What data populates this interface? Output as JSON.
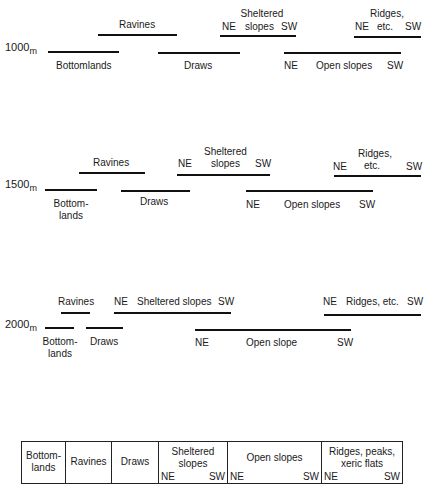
{
  "diagram": {
    "type": "topographic-position-diagram",
    "elevations": [
      {
        "value": "1000",
        "unit": "m",
        "positions": [
          {
            "name": "Bottomlands",
            "x1": 48,
            "x2": 119,
            "y": 52,
            "label_pos": "below"
          },
          {
            "name": "Ravines",
            "x1": 98,
            "x2": 177,
            "y": 35,
            "label_pos": "above"
          },
          {
            "name": "Draws",
            "x1": 158,
            "x2": 240,
            "y": 53,
            "label_pos": "below"
          },
          {
            "name": "Sheltered slopes",
            "x1": 220,
            "x2": 296,
            "y": 36,
            "label_pos": "above",
            "ne": "NE",
            "sw": "SW"
          },
          {
            "name": "Open slopes",
            "x1": 284,
            "x2": 401,
            "y": 53,
            "label_pos": "below",
            "ne": "NE",
            "sw": "SW"
          },
          {
            "name": "Ridges, etc.",
            "x1": 354,
            "x2": 421,
            "y": 37,
            "label_pos": "above",
            "ne": "NE",
            "sw": "SW"
          }
        ]
      },
      {
        "value": "1500",
        "unit": "m",
        "positions": [
          {
            "name": "Bottom-lands",
            "x1": 45,
            "x2": 97,
            "y": 189,
            "label_pos": "below"
          },
          {
            "name": "Ravines",
            "x1": 79,
            "x2": 145,
            "y": 173,
            "label_pos": "above"
          },
          {
            "name": "Draws",
            "x1": 121,
            "x2": 190,
            "y": 190,
            "label_pos": "below"
          },
          {
            "name": "Sheltered slopes",
            "x1": 177,
            "x2": 270,
            "y": 174,
            "label_pos": "above",
            "ne": "NE",
            "sw": "SW"
          },
          {
            "name": "Open slopes",
            "x1": 246,
            "x2": 373,
            "y": 191,
            "label_pos": "below",
            "ne": "NE",
            "sw": "SW"
          },
          {
            "name": "Ridges, etc.",
            "x1": 334,
            "x2": 421,
            "y": 176,
            "label_pos": "above",
            "ne": "NE",
            "sw": "SW"
          }
        ]
      },
      {
        "value": "2000",
        "unit": "m",
        "positions": [
          {
            "name": "Bottom-lands",
            "x1": 45,
            "x2": 74,
            "y": 328,
            "label_pos": "below"
          },
          {
            "name": "Ravines",
            "x1": 61,
            "x2": 90,
            "y": 313,
            "label_pos": "above"
          },
          {
            "name": "Draws",
            "x1": 86,
            "x2": 123,
            "y": 328,
            "label_pos": "below"
          },
          {
            "name": "Sheltered slopes",
            "x1": 114,
            "x2": 231,
            "y": 313,
            "label_pos": "above",
            "ne": "NE",
            "sw": "SW"
          },
          {
            "name": "Open slope",
            "x1": 195,
            "x2": 351,
            "y": 330,
            "label_pos": "below",
            "ne": "NE",
            "sw": "SW"
          },
          {
            "name": "Ridges, etc.",
            "x1": 324,
            "x2": 421,
            "y": 315,
            "label_pos": "above",
            "ne": "NE",
            "sw": "SW"
          }
        ]
      }
    ]
  },
  "labels": {
    "e1000": {
      "elev": "1000",
      "unit": "m",
      "ravines": "Ravines",
      "sheltered_l1": "Sheltered",
      "sheltered_l2": "slopes",
      "sheltered_ne": "NE",
      "sheltered_sw": "SW",
      "ridges_l1": "Ridges,",
      "ridges_l2": "etc.",
      "ridges_ne": "NE",
      "ridges_sw": "SW",
      "bottomlands": "Bottomlands",
      "draws": "Draws",
      "open_ne": "NE",
      "open": "Open slopes",
      "open_sw": "SW"
    },
    "e1500": {
      "elev": "1500",
      "unit": "m",
      "ravines": "Ravines",
      "sheltered_ne": "NE",
      "sheltered_l1": "Sheltered",
      "sheltered_l2": "slopes",
      "sheltered_sw": "SW",
      "ridges_ne": "NE",
      "ridges_l1": "Ridges,",
      "ridges_l2": "etc.",
      "ridges_sw": "SW",
      "bottom_l1": "Bottom-",
      "bottom_l2": "lands",
      "draws": "Draws",
      "open_ne": "NE",
      "open": "Open slopes",
      "open_sw": "SW"
    },
    "e2000": {
      "elev": "2000",
      "unit": "m",
      "ravines": "Ravines",
      "sheltered_ne": "NE",
      "sheltered": "Sheltered slopes",
      "sheltered_sw": "SW",
      "ridges_ne": "NE",
      "ridges": "Ridges, etc.",
      "ridges_sw": "SW",
      "bottom_l1": "Bottom-",
      "bottom_l2": "lands",
      "draws": "Draws",
      "open_ne": "NE",
      "open": "Open slope",
      "open_sw": "SW"
    }
  },
  "legend": {
    "cells": [
      {
        "l1": "Bottom-",
        "l2": "lands"
      },
      {
        "l1": "Ravines"
      },
      {
        "l1": "Draws"
      },
      {
        "l1": "Sheltered",
        "l2": "slopes",
        "ne": "NE",
        "sw": "SW"
      },
      {
        "l1": "Open slopes",
        "ne": "NE",
        "sw": "SW"
      },
      {
        "l1": "Ridges, peaks,",
        "l2": "xeric flats",
        "ne": "NE",
        "sw": "SW"
      }
    ]
  },
  "colors": {
    "line": "#111111",
    "text": "#1a1a1a",
    "background": "#ffffff"
  }
}
